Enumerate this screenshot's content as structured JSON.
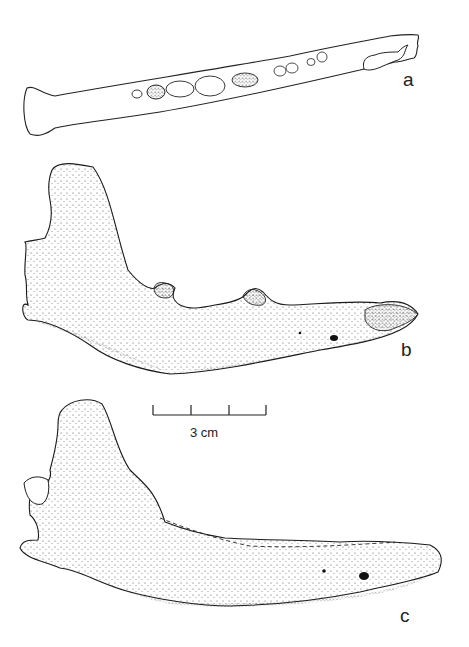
{
  "figure": {
    "panels": [
      {
        "label": "a",
        "view": "occlusal"
      },
      {
        "label": "b",
        "view": "lateral"
      },
      {
        "label": "c",
        "view": "lateral"
      }
    ],
    "scale_bar": {
      "text": "3 cm",
      "segments": 3
    },
    "colors": {
      "ink": "#1a1a1a",
      "background": "#ffffff"
    }
  }
}
